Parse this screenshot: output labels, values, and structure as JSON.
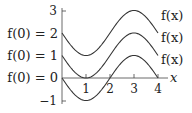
{
  "chart_data": {
    "type": "line",
    "title": "",
    "xlabel": "x",
    "ylabel": "",
    "xlim": [
      0,
      4
    ],
    "ylim": [
      -1,
      3
    ],
    "x_ticks": [
      "1",
      "2",
      "3",
      "4"
    ],
    "y_ticks": [
      "-1",
      "3"
    ],
    "grid": false,
    "series": [
      {
        "name": "f(x)",
        "initial_label": "f(0) = 2",
        "offset": 2,
        "x": [
          0,
          1,
          2,
          3,
          4
        ],
        "values": [
          2,
          1,
          2,
          3,
          2
        ]
      },
      {
        "name": "f(x)",
        "initial_label": "f(0) = 1",
        "offset": 1,
        "x": [
          0,
          1,
          2,
          3,
          4
        ],
        "values": [
          1,
          0,
          1,
          2,
          1
        ]
      },
      {
        "name": "f(x)",
        "initial_label": "f(0) = 0",
        "offset": 0,
        "x": [
          0,
          1,
          2,
          3,
          4
        ],
        "values": [
          0,
          -1,
          0,
          1,
          0
        ]
      }
    ]
  },
  "labels": {
    "y_tick_top": "3",
    "y_tick_bottom": "−1",
    "x_ticks": [
      "1",
      "2",
      "3",
      "4"
    ],
    "x_axis": "x",
    "left": [
      "f(0) = 2",
      "f(0) = 1",
      "f(0) = 0"
    ],
    "right": [
      "f(x)",
      "f(x)",
      "f(x)"
    ]
  }
}
